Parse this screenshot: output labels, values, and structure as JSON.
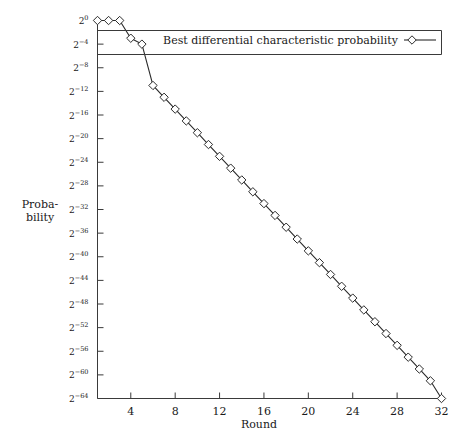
{
  "chart_data": {
    "type": "line",
    "title": "",
    "xlabel": "Round",
    "ylabel": "Probability",
    "ylabel_line1": "Proba-",
    "ylabel_line2": "bility",
    "legend": [
      "Best differential characteristic probability"
    ],
    "legend_position": "top-right",
    "grid": false,
    "marker": "diamond",
    "xlim": [
      1,
      32
    ],
    "ylim": [
      -64,
      0
    ],
    "y_is_log2_exponent": true,
    "xticks": [
      4,
      8,
      12,
      16,
      20,
      24,
      28,
      32
    ],
    "xtick_labels": [
      "4",
      "8",
      "12",
      "16",
      "20",
      "24",
      "28",
      "32"
    ],
    "yticks": [
      0,
      -4,
      -8,
      -12,
      -16,
      -20,
      -24,
      -28,
      -32,
      -36,
      -40,
      -44,
      -48,
      -52,
      -56,
      -60,
      -64
    ],
    "ytick_labels": [
      "2^0",
      "2^-4",
      "2^-8",
      "2^-12",
      "2^-16",
      "2^-20",
      "2^-24",
      "2^-28",
      "2^-32",
      "2^-36",
      "2^-40",
      "2^-44",
      "2^-48",
      "2^-52",
      "2^-56",
      "2^-60",
      "2^-64"
    ],
    "ytick_bases": [
      "2",
      "2",
      "2",
      "2",
      "2",
      "2",
      "2",
      "2",
      "2",
      "2",
      "2",
      "2",
      "2",
      "2",
      "2",
      "2",
      "2"
    ],
    "ytick_exponents": [
      "0",
      "−4",
      "−8",
      "−12",
      "−16",
      "−20",
      "−24",
      "−28",
      "−32",
      "−36",
      "−40",
      "−44",
      "−48",
      "−52",
      "−56",
      "−60",
      "−64"
    ],
    "x": [
      1,
      2,
      3,
      4,
      5,
      6,
      7,
      8,
      9,
      10,
      11,
      12,
      13,
      14,
      15,
      16,
      17,
      18,
      19,
      20,
      21,
      22,
      23,
      24,
      25,
      26,
      27,
      28,
      29,
      30,
      31,
      32
    ],
    "series": [
      {
        "name": "Best differential characteristic probability",
        "values_log2": [
          0,
          0,
          0,
          -3,
          -4,
          -11,
          -13,
          -15,
          -17,
          -19,
          -21,
          -23,
          -25,
          -27,
          -29,
          -31,
          -33,
          -35,
          -37,
          -39,
          -41,
          -43,
          -45,
          -47,
          -49,
          -51,
          -53,
          -55,
          -57,
          -59,
          -61,
          -64
        ]
      }
    ]
  },
  "axes": {
    "x_title": "Round",
    "y_title_line1": "Proba-",
    "y_title_line2": "bility"
  },
  "legend": {
    "entry_label": "Best differential characteristic probability"
  }
}
